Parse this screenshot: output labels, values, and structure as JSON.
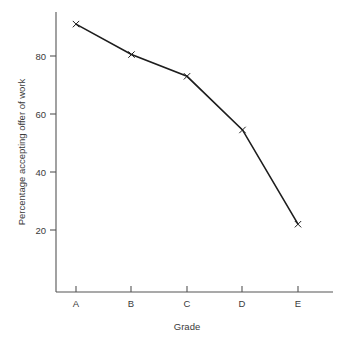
{
  "chart_data": {
    "type": "line",
    "title": "",
    "subtitle": "",
    "xlabel": "Grade",
    "ylabel": "Percentage accepting offer of work",
    "categories": [
      "A",
      "B",
      "C",
      "D",
      "E"
    ],
    "values": [
      91,
      80.5,
      73,
      54.5,
      22
    ],
    "series": [
      {
        "name": "Percentage accepting offer of work",
        "values": [
          91,
          80.5,
          73,
          54.5,
          22
        ]
      }
    ],
    "ylim": [
      0,
      96
    ],
    "y_ticks": [
      20,
      40,
      60,
      80
    ],
    "y_tick_labels": [
      "20",
      "40",
      "60",
      "80"
    ],
    "x_tick_labels": [
      "A",
      "B",
      "C",
      "D",
      "E"
    ],
    "grid": false,
    "legend": "none",
    "marker": "x",
    "line_color": "#1d1d1d",
    "axis_color": "#555555",
    "background": "#ffffff"
  },
  "axes": {
    "y_axis_title": "Percentage accepting offer of work",
    "x_axis_title": "Grade"
  },
  "ticks": {
    "y": [
      {
        "label": "80",
        "value": 80
      },
      {
        "label": "60",
        "value": 60
      },
      {
        "label": "40",
        "value": 40
      },
      {
        "label": "20",
        "value": 20
      }
    ],
    "x": [
      {
        "label": "A",
        "value": 91
      },
      {
        "label": "B",
        "value": 80.5
      },
      {
        "label": "C",
        "value": 73
      },
      {
        "label": "D",
        "value": 54.5
      },
      {
        "label": "E",
        "value": 22
      }
    ]
  }
}
